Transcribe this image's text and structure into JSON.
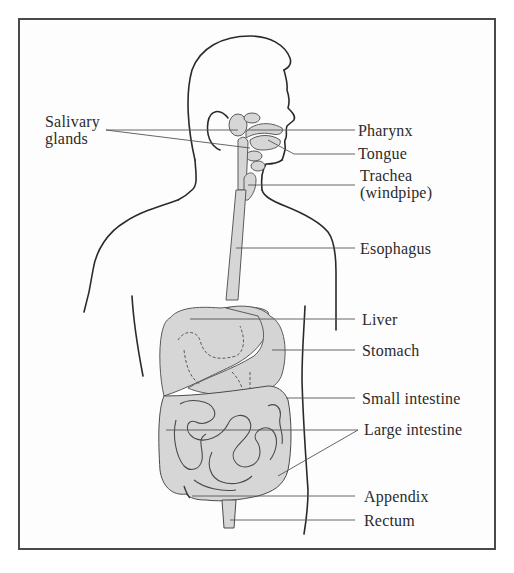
{
  "diagram": {
    "colors": {
      "frame": "#4a4a4a",
      "outline": "#2a2a2a",
      "organ_fill": "#d6d6d6",
      "organ_stroke": "#5a5a5a",
      "leader": "#555555",
      "text": "#2b2b2b"
    },
    "labels": {
      "salivary_glands": {
        "line1": "Salivary",
        "line2": "glands"
      },
      "pharynx": "Pharynx",
      "tongue": "Tongue",
      "trachea": {
        "line1": "Trachea",
        "line2": "(windpipe)"
      },
      "esophagus": "Esophagus",
      "liver": "Liver",
      "stomach": "Stomach",
      "small_intestine": "Small intestine",
      "large_intestine": "Large intestine",
      "appendix": "Appendix",
      "rectum": "Rectum"
    }
  }
}
